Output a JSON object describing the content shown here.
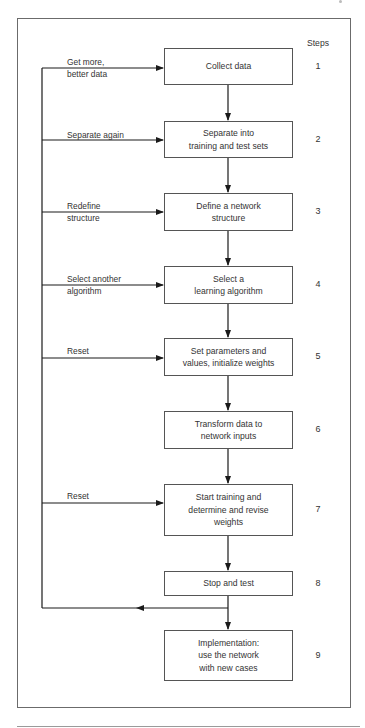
{
  "diagram": {
    "type": "flowchart",
    "steps_header": "Steps",
    "steps": [
      {
        "number": "1",
        "label": "Collect data",
        "top": 48,
        "height": 37,
        "feedback": "Get more,\nbetter data",
        "fb_top": 56,
        "arrow_y": 68
      },
      {
        "number": "2",
        "label": "Separate into\ntraining and test sets",
        "top": 121,
        "height": 37,
        "feedback": "Separate again",
        "fb_top": 129,
        "arrow_y": 140
      },
      {
        "number": "3",
        "label": "Define a network\nstructure",
        "top": 193,
        "height": 38,
        "feedback": "Redefine\nstructure",
        "fb_top": 200,
        "arrow_y": 212
      },
      {
        "number": "4",
        "label": "Select a\nlearning algorithm",
        "top": 266,
        "height": 38,
        "feedback": "Select another\nalgorithm",
        "fb_top": 273,
        "arrow_y": 285
      },
      {
        "number": "5",
        "label": "Set parameters and\nvalues, initialize weights",
        "top": 338,
        "height": 38,
        "feedback": "Reset",
        "fb_top": 345,
        "arrow_y": 358
      },
      {
        "number": "6",
        "label": "Transform data to\nnetwork inputs",
        "top": 411,
        "height": 38,
        "feedback": null
      },
      {
        "number": "7",
        "label": "Start training and\ndetermine and revise\nweights",
        "top": 484,
        "height": 52,
        "feedback": "Reset",
        "fb_top": 490,
        "arrow_y": 503
      },
      {
        "number": "8",
        "label": "Stop and test",
        "top": 571,
        "height": 25,
        "feedback": null
      },
      {
        "number": "9",
        "label": "Implementation:\nuse the network\nwith new cases",
        "top": 630,
        "height": 51,
        "feedback": null
      }
    ],
    "line_color": "#1a1a1a",
    "frame_color": "#6b6b6b"
  }
}
